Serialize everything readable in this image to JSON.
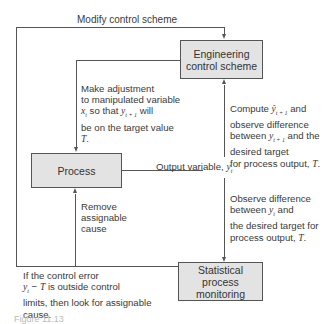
{
  "diagram": {
    "boxes": {
      "engineering": "Engineering control scheme",
      "process": "Process",
      "spm": "Statistical process monitoring"
    },
    "labels": {
      "modify": "Modify control scheme",
      "adjust": "Make adjustment\nto manipulated variable\nx_t so that y_{t+1} will\nbe on the target value\nT.",
      "compute": "Compute ŷ_{t+1} and\nobserve difference\nbetween y_{t+1} and the\ndesired target\nfor process output, T.",
      "output": "Output variable, y_t",
      "observe": "Observe difference\nbetween y_t and\nthe desired target for\nprocess output, T.",
      "remove": "Remove\nassignable\ncause",
      "control_error": "If the control error\ny_t − T is outside control\nlimits, then look for assignable\ncause."
    },
    "caption": "Figure 11.13"
  }
}
